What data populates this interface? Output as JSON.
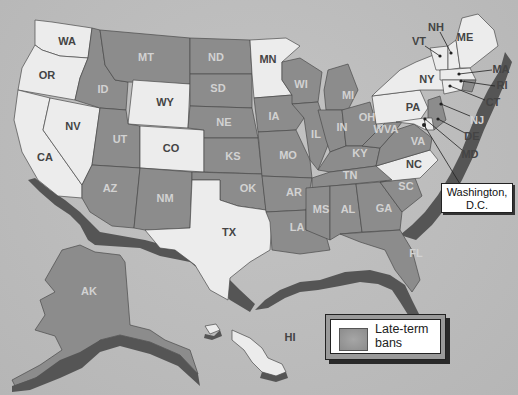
{
  "map": {
    "legend": {
      "label": "Late-term bans",
      "line1": "Late-term",
      "line2": "bans",
      "swatch_color": "#8c8c8c"
    },
    "callout": {
      "line1": "Washington,",
      "line2": "D.C."
    },
    "colors": {
      "ban": "#8c8c8c",
      "no_ban": "#ececec",
      "background": "#b9b9b9",
      "extrusion": "#555555"
    },
    "states": [
      {
        "abbr": "WA",
        "ban": false
      },
      {
        "abbr": "OR",
        "ban": false
      },
      {
        "abbr": "CA",
        "ban": false
      },
      {
        "abbr": "NV",
        "ban": false
      },
      {
        "abbr": "ID",
        "ban": true
      },
      {
        "abbr": "MT",
        "ban": true
      },
      {
        "abbr": "WY",
        "ban": false
      },
      {
        "abbr": "UT",
        "ban": true
      },
      {
        "abbr": "AZ",
        "ban": true
      },
      {
        "abbr": "CO",
        "ban": false
      },
      {
        "abbr": "NM",
        "ban": true
      },
      {
        "abbr": "ND",
        "ban": true
      },
      {
        "abbr": "SD",
        "ban": true
      },
      {
        "abbr": "NE",
        "ban": true
      },
      {
        "abbr": "KS",
        "ban": true
      },
      {
        "abbr": "OK",
        "ban": true
      },
      {
        "abbr": "TX",
        "ban": false
      },
      {
        "abbr": "MN",
        "ban": false
      },
      {
        "abbr": "IA",
        "ban": true
      },
      {
        "abbr": "MO",
        "ban": true
      },
      {
        "abbr": "AR",
        "ban": true
      },
      {
        "abbr": "LA",
        "ban": true
      },
      {
        "abbr": "WI",
        "ban": true
      },
      {
        "abbr": "IL",
        "ban": true
      },
      {
        "abbr": "MI",
        "ban": true
      },
      {
        "abbr": "IN",
        "ban": true
      },
      {
        "abbr": "OH",
        "ban": true
      },
      {
        "abbr": "KY",
        "ban": true
      },
      {
        "abbr": "TN",
        "ban": true
      },
      {
        "abbr": "MS",
        "ban": true
      },
      {
        "abbr": "AL",
        "ban": true
      },
      {
        "abbr": "GA",
        "ban": true
      },
      {
        "abbr": "FL",
        "ban": true
      },
      {
        "abbr": "SC",
        "ban": true
      },
      {
        "abbr": "NC",
        "ban": false
      },
      {
        "abbr": "VA",
        "ban": true
      },
      {
        "abbr": "WVA",
        "ban": true
      },
      {
        "abbr": "PA",
        "ban": false
      },
      {
        "abbr": "NY",
        "ban": false
      },
      {
        "abbr": "VT",
        "ban": false
      },
      {
        "abbr": "NH",
        "ban": false
      },
      {
        "abbr": "ME",
        "ban": false
      },
      {
        "abbr": "MA",
        "ban": false
      },
      {
        "abbr": "RI",
        "ban": true
      },
      {
        "abbr": "CT",
        "ban": false
      },
      {
        "abbr": "NJ",
        "ban": true
      },
      {
        "abbr": "DE",
        "ban": false
      },
      {
        "abbr": "MD",
        "ban": false
      },
      {
        "abbr": "AK",
        "ban": true
      },
      {
        "abbr": "HI",
        "ban": false
      }
    ]
  }
}
